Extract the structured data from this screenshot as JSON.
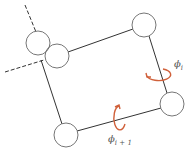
{
  "diagram": {
    "nodes": [
      {
        "id": "A",
        "cx": 38,
        "cy": 43,
        "r": 12
      },
      {
        "id": "B",
        "cx": 57,
        "cy": 56,
        "r": 12
      },
      {
        "id": "C",
        "cx": 144,
        "cy": 25,
        "r": 12
      },
      {
        "id": "D",
        "cx": 66,
        "cy": 135,
        "r": 12
      },
      {
        "id": "E",
        "cx": 172,
        "cy": 104,
        "r": 12
      }
    ],
    "edges": [
      {
        "from": "B",
        "to": "C",
        "style": "solid"
      },
      {
        "from": "C",
        "to": "E",
        "style": "solid"
      },
      {
        "from": "E",
        "to": "D",
        "style": "solid"
      },
      {
        "from": "D",
        "to": "B",
        "style": "solid"
      }
    ],
    "dashed_lines": [
      {
        "x1": 25,
        "y1": 5,
        "x2": 36,
        "y2": 32
      },
      {
        "x1": 5,
        "y1": 72,
        "x2": 42,
        "y2": 60
      }
    ],
    "labels": {
      "phi_i": {
        "base": "ϕ",
        "sub": "i"
      },
      "phi_i_plus_1": {
        "base": "ϕ",
        "sub": "i + 1"
      }
    },
    "colors": {
      "line": "#333333",
      "circle": "#666666",
      "rotation_arrow": "#d0603a",
      "label": "#555555"
    }
  }
}
